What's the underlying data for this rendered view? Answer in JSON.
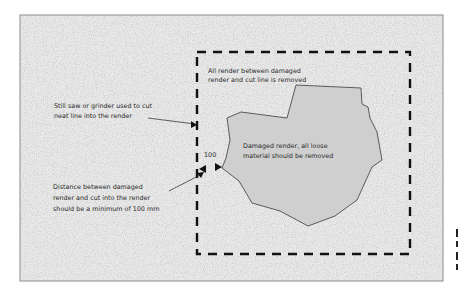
{
  "diagram": {
    "colors": {
      "panel_fill": "#e9e9e9",
      "panel_border": "#8a8a8a",
      "damaged_fill": "#cfcfcf",
      "damaged_stroke": "#3a3a3a",
      "dash_stroke": "#111111",
      "text": "#2a2a2a"
    },
    "labels": {
      "removed_zone": [
        "All render between damaged",
        "render and cut line is removed"
      ],
      "saw_cut": [
        "Still saw or grinder used to cut",
        "neat line into the render"
      ],
      "damaged": [
        "Damaged render, all loose",
        "material should be removed"
      ],
      "distance": [
        "Distance between damaged",
        "render and cut into the render",
        "should be a minimum of 100 mm"
      ],
      "dimension_value": "100"
    }
  }
}
